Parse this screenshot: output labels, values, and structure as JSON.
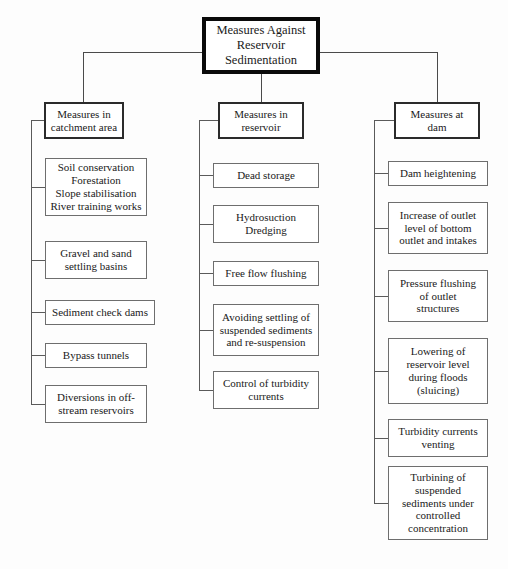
{
  "diagram": {
    "title": "Measures Against\nReservoir\nSedimentation",
    "branches": [
      {
        "header": "Measures in\ncatchment area",
        "leaves": [
          "Soil conservation\nForestation\nSlope stabilisation\nRiver training works",
          "Gravel and sand\nsettling basins",
          "Sediment check dams",
          "Bypass tunnels",
          "Diversions in off-\nstream reservoirs"
        ]
      },
      {
        "header": "Measures in\nreservoir",
        "leaves": [
          "Dead storage",
          "Hydrosuction\nDredging",
          "Free flow flushing",
          "Avoiding settling of\nsuspended sediments\nand re-suspension",
          "Control of turbidity\ncurrents"
        ]
      },
      {
        "header": "Measures at\ndam",
        "leaves": [
          "Dam heightening",
          "Increase of outlet\nlevel of bottom\noutlet and intakes",
          "Pressure flushing\nof outlet\nstructures",
          "Lowering of\nreservoir level\nduring floods\n(sluicing)",
          "Turbidity currents\nventing",
          "Turbining of\nsuspended\nsediments under\ncontrolled\nconcentration"
        ]
      }
    ]
  }
}
